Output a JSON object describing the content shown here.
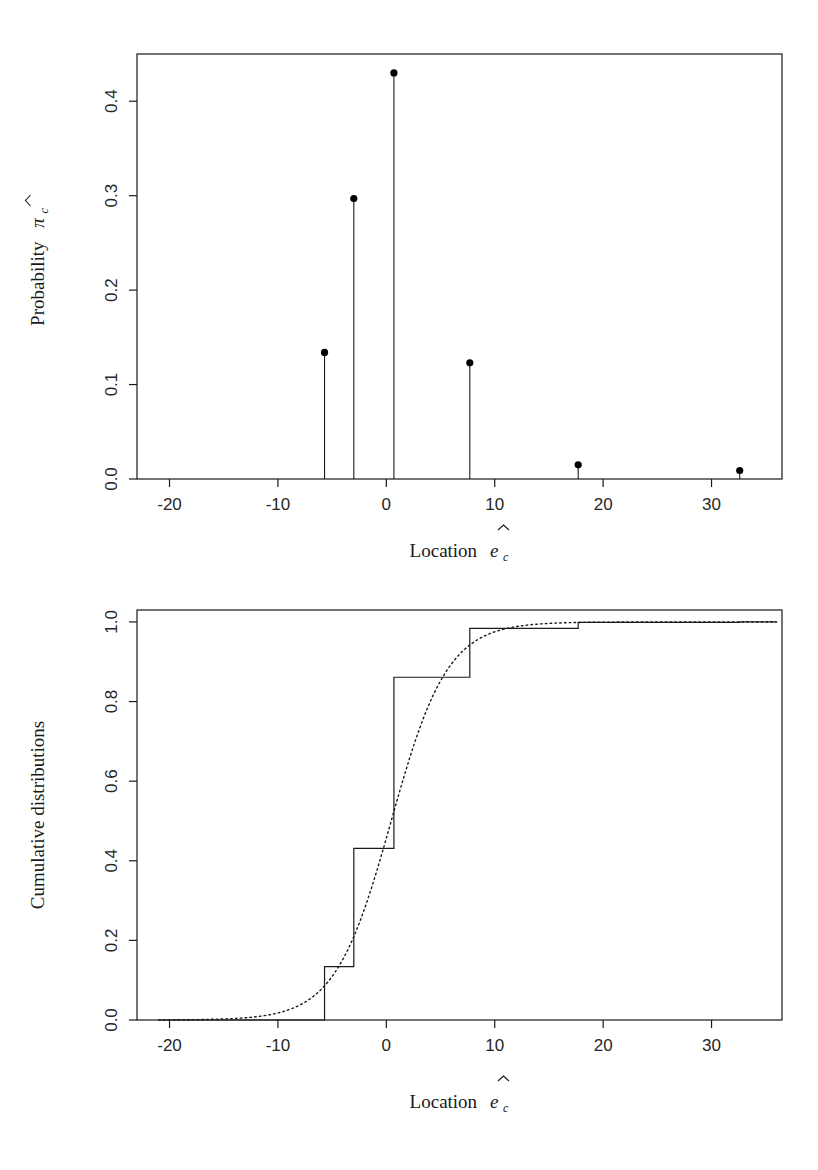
{
  "figure": {
    "background": "#ffffff",
    "ink_color": "#1a1a1a"
  },
  "chart_data": [
    {
      "id": "top-panel",
      "type": "bar",
      "render_style": "stem-with-point-markers",
      "title": "",
      "xlabel": "Location êc",
      "ylabel": "Probability π̂c",
      "xlabel_parts": {
        "text": "Location",
        "symbol": "e",
        "hat": true,
        "subscript": "c"
      },
      "ylabel_parts": {
        "text": "Probability",
        "symbol": "π",
        "hat": true,
        "subscript": "c"
      },
      "xlim": [
        -23.0,
        36.5
      ],
      "ylim": [
        0.0,
        0.45
      ],
      "xticks": [
        -20,
        -10,
        0,
        10,
        20,
        30
      ],
      "xtick_labels": [
        "-20",
        "-10",
        "0",
        "10",
        "20",
        "30"
      ],
      "yticks": [
        0.0,
        0.1,
        0.2,
        0.3,
        0.4
      ],
      "ytick_labels": [
        "0.0",
        "0.1",
        "0.2",
        "0.3",
        "0.4"
      ],
      "grid": false,
      "legend": "none",
      "x": [
        -5.7,
        -3.0,
        0.7,
        7.7,
        17.7,
        32.6
      ],
      "values": [
        0.134,
        0.297,
        0.43,
        0.123,
        0.015,
        0.009
      ],
      "point_marker": "filled-circle",
      "marker_color": "#000000",
      "line_color": "#1a1a1a"
    },
    {
      "id": "bottom-panel",
      "type": "line",
      "render_style": "step-ecdf-plus-dotted-fitted-cdf",
      "title": "",
      "xlabel": "Location êc",
      "ylabel": "Cumulative distributions",
      "xlabel_parts": {
        "text": "Location",
        "symbol": "e",
        "hat": true,
        "subscript": "c"
      },
      "xlim": [
        -23.0,
        36.5
      ],
      "ylim": [
        0.0,
        1.03
      ],
      "xticks": [
        -20,
        -10,
        0,
        10,
        20,
        30
      ],
      "xtick_labels": [
        "-20",
        "-10",
        "0",
        "10",
        "20",
        "30"
      ],
      "yticks": [
        0.0,
        0.2,
        0.4,
        0.6,
        0.8,
        1.0
      ],
      "ytick_labels": [
        "0.0",
        "0.2",
        "0.4",
        "0.6",
        "0.8",
        "1.0"
      ],
      "grid": false,
      "legend": "none",
      "series": [
        {
          "name": "Empirical step CDF",
          "style": "solid-step",
          "color": "#1a1a1a",
          "x": [
            -5.7,
            -3.0,
            0.7,
            7.7,
            17.7,
            32.6
          ],
          "values": [
            0.134,
            0.431,
            0.861,
            0.984,
            0.999,
            1.0
          ],
          "start_x": -21.0,
          "start_value": 0.0,
          "end_x": 36.0
        },
        {
          "name": "Fitted smooth CDF",
          "style": "dotted",
          "color": "#1a1a1a",
          "distribution": "logistic",
          "location": 0.45,
          "scale": 2.6,
          "x_range": [
            -21.0,
            36.0
          ]
        }
      ]
    }
  ]
}
